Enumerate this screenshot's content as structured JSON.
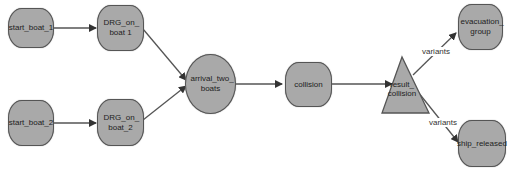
{
  "diagram": {
    "nodes": {
      "start_boat_1": {
        "label": "start_boat_1",
        "shape": "rounded-rect"
      },
      "drg_on_boat_1": {
        "label": "DRG_on_ boat 1",
        "shape": "rounded-rect"
      },
      "start_boat_2": {
        "label": "start_boat_2",
        "shape": "rounded-rect"
      },
      "drg_on_boat_2": {
        "label": "DRG_on_ boat_2",
        "shape": "rounded-rect"
      },
      "arrival_two_boats": {
        "label": "arrival_two_ boats",
        "shape": "ellipse"
      },
      "collision": {
        "label": "collision",
        "shape": "rounded-rect"
      },
      "result_collision": {
        "label": "result_ collision",
        "shape": "triangle"
      },
      "evacuation_group": {
        "label": "evacuation_ group",
        "shape": "rounded-rect"
      },
      "ship_released": {
        "label": "ship_released",
        "shape": "rounded-rect"
      }
    },
    "edges": [
      {
        "from": "start_boat_1",
        "to": "drg_on_boat_1",
        "label": ""
      },
      {
        "from": "start_boat_2",
        "to": "drg_on_boat_2",
        "label": ""
      },
      {
        "from": "drg_on_boat_1",
        "to": "arrival_two_boats",
        "label": ""
      },
      {
        "from": "drg_on_boat_2",
        "to": "arrival_two_boats",
        "label": ""
      },
      {
        "from": "arrival_two_boats",
        "to": "collision",
        "label": ""
      },
      {
        "from": "collision",
        "to": "result_collision",
        "label": ""
      },
      {
        "from": "result_collision",
        "to": "evacuation_group",
        "label": "variants"
      },
      {
        "from": "result_collision",
        "to": "ship_released",
        "label": "variants"
      }
    ],
    "edge_labels": {
      "variants_top": "variants",
      "variants_bottom": "variants"
    },
    "colors": {
      "node_fill": "#a9a9a9",
      "node_border": "#555555",
      "edge": "#444444",
      "background": "#ffffff"
    }
  }
}
